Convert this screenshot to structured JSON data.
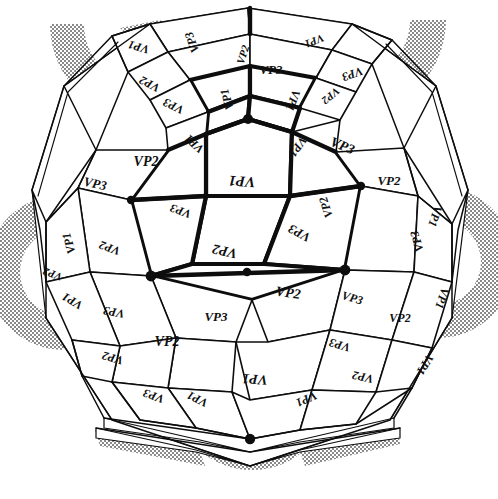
{
  "figure": {
    "kind": "polyhedron-sphere-diagram",
    "background_color": "#ffffff",
    "ink_color": "#0d0d0d",
    "shade_color": "#8a8a8a",
    "label_set": [
      "VP1",
      "VP2",
      "VP3"
    ],
    "width": 498,
    "height": 499
  },
  "labels": [
    {
      "id": "l01",
      "text": "VP1",
      "x": 139,
      "y": 46,
      "size": 12,
      "rot": 196
    },
    {
      "id": "l02",
      "text": "VP3",
      "x": 193,
      "y": 42,
      "size": 12,
      "rot": 250
    },
    {
      "id": "l03",
      "text": "VP2",
      "x": 150,
      "y": 83,
      "size": 12,
      "rot": 208
    },
    {
      "id": "l04",
      "text": "VP2",
      "x": 244,
      "y": 55,
      "size": 11,
      "rot": 288
    },
    {
      "id": "l05",
      "text": "VP1",
      "x": 314,
      "y": 40,
      "size": 11,
      "rot": 158
    },
    {
      "id": "l06",
      "text": "VP3",
      "x": 271,
      "y": 71,
      "size": 13,
      "rot": 0
    },
    {
      "id": "l07",
      "text": "VP3",
      "x": 352,
      "y": 73,
      "size": 12,
      "rot": 160
    },
    {
      "id": "l08",
      "text": "VP2",
      "x": 330,
      "y": 95,
      "size": 11,
      "rot": 140
    },
    {
      "id": "l09",
      "text": "VP1",
      "x": 228,
      "y": 99,
      "size": 12,
      "rot": 254
    },
    {
      "id": "l10",
      "text": "VP3",
      "x": 174,
      "y": 105,
      "size": 12,
      "rot": 206
    },
    {
      "id": "l11",
      "text": "VP1",
      "x": 292,
      "y": 100,
      "size": 12,
      "rot": 110
    },
    {
      "id": "l12",
      "text": "VP1",
      "x": 195,
      "y": 143,
      "size": 12,
      "rot": 222
    },
    {
      "id": "l13",
      "text": "VP1",
      "x": 297,
      "y": 146,
      "size": 12,
      "rot": 126
    },
    {
      "id": "l14",
      "text": "VP3",
      "x": 342,
      "y": 147,
      "size": 14,
      "rot": 22
    },
    {
      "id": "l15",
      "text": "VP2",
      "x": 146,
      "y": 163,
      "size": 14,
      "rot": 0
    },
    {
      "id": "l16",
      "text": "VP1",
      "x": 242,
      "y": 180,
      "size": 15,
      "rot": 184
    },
    {
      "id": "l17",
      "text": "VP3",
      "x": 95,
      "y": 185,
      "size": 13,
      "rot": 12
    },
    {
      "id": "l18",
      "text": "VP2",
      "x": 389,
      "y": 182,
      "size": 13,
      "rot": 0
    },
    {
      "id": "l19",
      "text": "VP3",
      "x": 181,
      "y": 210,
      "size": 12,
      "rot": 200
    },
    {
      "id": "l20",
      "text": "VP2",
      "x": 327,
      "y": 207,
      "size": 12,
      "rot": 252
    },
    {
      "id": "l21",
      "text": "VP1",
      "x": 434,
      "y": 216,
      "size": 12,
      "rot": 108
    },
    {
      "id": "l22",
      "text": "VP3",
      "x": 300,
      "y": 232,
      "size": 13,
      "rot": 208
    },
    {
      "id": "l23",
      "text": "VP1",
      "x": 70,
      "y": 243,
      "size": 12,
      "rot": 254
    },
    {
      "id": "l24",
      "text": "VP2",
      "x": 110,
      "y": 247,
      "size": 12,
      "rot": 200
    },
    {
      "id": "l25",
      "text": "VP3",
      "x": 418,
      "y": 241,
      "size": 12,
      "rot": 254
    },
    {
      "id": "l26",
      "text": "VP2",
      "x": 225,
      "y": 250,
      "size": 14,
      "rot": 192
    },
    {
      "id": "l27",
      "text": "VP1",
      "x": 73,
      "y": 300,
      "size": 12,
      "rot": 210
    },
    {
      "id": "l28",
      "text": "VP2",
      "x": 288,
      "y": 294,
      "size": 14,
      "rot": 8
    },
    {
      "id": "l29",
      "text": "VP3",
      "x": 114,
      "y": 311,
      "size": 12,
      "rot": 190
    },
    {
      "id": "l30",
      "text": "VP3",
      "x": 352,
      "y": 299,
      "size": 12,
      "rot": 16
    },
    {
      "id": "l31",
      "text": "VP2",
      "x": 400,
      "y": 319,
      "size": 12,
      "rot": 0
    },
    {
      "id": "l32",
      "text": "VP1",
      "x": 441,
      "y": 298,
      "size": 12,
      "rot": 108
    },
    {
      "id": "l33",
      "text": "VP2",
      "x": 167,
      "y": 343,
      "size": 14,
      "rot": 0
    },
    {
      "id": "l34",
      "text": "VP3",
      "x": 216,
      "y": 318,
      "size": 13,
      "rot": 0
    },
    {
      "id": "l35",
      "text": "VP3",
      "x": 340,
      "y": 344,
      "size": 12,
      "rot": 196
    },
    {
      "id": "l36",
      "text": "VP2",
      "x": 113,
      "y": 357,
      "size": 12,
      "rot": 196
    },
    {
      "id": "l37",
      "text": "VP2",
      "x": 363,
      "y": 376,
      "size": 12,
      "rot": 192
    },
    {
      "id": "l38",
      "text": "VP1",
      "x": 424,
      "y": 364,
      "size": 12,
      "rot": 122
    },
    {
      "id": "l39",
      "text": "VP1",
      "x": 255,
      "y": 378,
      "size": 14,
      "rot": 184
    },
    {
      "id": "l40",
      "text": "VP1",
      "x": 198,
      "y": 398,
      "size": 12,
      "rot": 206
    },
    {
      "id": "l41",
      "text": "VP1",
      "x": 306,
      "y": 398,
      "size": 12,
      "rot": 156
    },
    {
      "id": "l42",
      "text": "VP3",
      "x": 154,
      "y": 395,
      "size": 12,
      "rot": 200
    },
    {
      "id": "l43",
      "text": "VP2",
      "x": 53,
      "y": 273,
      "size": 11,
      "rot": 200
    }
  ],
  "vertices": [
    {
      "id": "v-top",
      "x": 248,
      "y": 119,
      "r": 5.0
    },
    {
      "id": "v-left",
      "x": 151,
      "y": 276,
      "r": 5.4
    },
    {
      "id": "v-right",
      "x": 345,
      "y": 270,
      "r": 5.4
    },
    {
      "id": "v-bottom",
      "x": 250,
      "y": 439,
      "r": 5.2
    },
    {
      "id": "v-mid-left",
      "x": 131,
      "y": 200,
      "r": 4.2
    },
    {
      "id": "v-mid-right",
      "x": 361,
      "y": 186,
      "r": 4.2
    },
    {
      "id": "v-mid-low",
      "x": 247,
      "y": 272,
      "r": 4.2
    }
  ]
}
